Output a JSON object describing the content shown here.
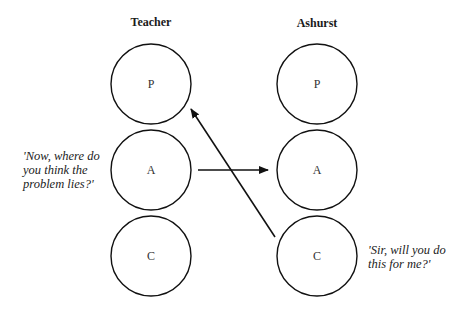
{
  "columns": [
    {
      "title": "Teacher",
      "circles": [
        "P",
        "A",
        "C"
      ]
    },
    {
      "title": "Ashurst",
      "circles": [
        "P",
        "A",
        "C"
      ]
    }
  ],
  "quotes": {
    "teacher": [
      "'Now, where do",
      "you think the",
      "problem lies?'"
    ],
    "ashurst": [
      "'Sir, will you do",
      "this for me?'"
    ]
  },
  "arrows": [
    {
      "from": "Teacher.A",
      "to": "Ashurst.A"
    },
    {
      "from": "Ashurst.C",
      "to": "Teacher.P"
    }
  ],
  "colors": {
    "stroke": "#111111",
    "background": "#ffffff"
  }
}
